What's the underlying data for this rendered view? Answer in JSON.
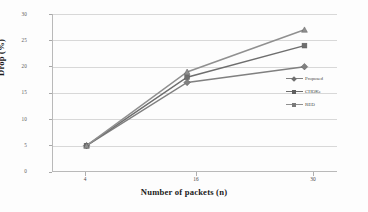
{
  "chart_data": {
    "type": "line",
    "title": "",
    "xlabel": "Number of packets (n)",
    "ylabel": "Drop (%)",
    "categories": [
      "4",
      "16",
      "30"
    ],
    "x": [
      4,
      16,
      30
    ],
    "xlim": [
      0,
      34
    ],
    "ylim": [
      0,
      30
    ],
    "yticks": [
      0,
      5,
      10,
      15,
      20,
      25,
      30
    ],
    "ytick_labels": [
      "0",
      "5",
      "10",
      "15",
      "20",
      "25",
      "30"
    ],
    "xtick_labels": [
      "4",
      "16",
      "30"
    ],
    "grid": "horizontal",
    "legend_position": "center-right-inside",
    "series": [
      {
        "name": "Proposed",
        "values": [
          5,
          17,
          20
        ],
        "color": "#808080",
        "marker": "diamond"
      },
      {
        "name": "CHOKe",
        "values": [
          5,
          18,
          24
        ],
        "color": "#6e6e6e",
        "marker": "square"
      },
      {
        "name": "RED",
        "values": [
          5,
          19,
          27
        ],
        "color": "#909090",
        "marker": "triangle"
      }
    ]
  },
  "legend": {
    "items": [
      {
        "label": "Proposed"
      },
      {
        "label": "CHOKe"
      },
      {
        "label": "RED"
      }
    ]
  },
  "axes": {
    "x_title": "Number of packets (n)",
    "y_title": "Drop (%)",
    "y_labels": [
      "30",
      "25",
      "20",
      "15",
      "10",
      "5",
      "0"
    ],
    "x_labels": [
      "4",
      "16",
      "30"
    ]
  }
}
